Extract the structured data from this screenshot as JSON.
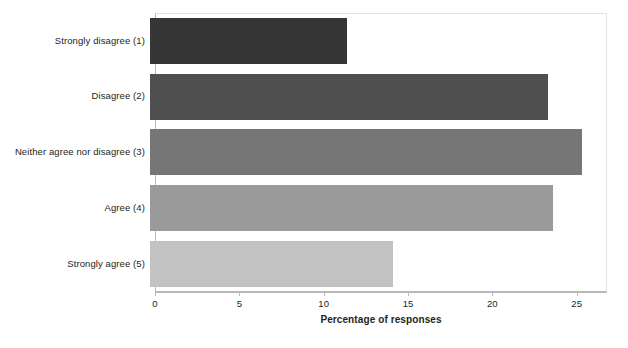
{
  "chart_data": {
    "type": "bar",
    "orientation": "horizontal",
    "title": "",
    "xlabel": "Percentage of responses",
    "ylabel": "",
    "xlim": [
      0,
      26.8
    ],
    "ylim": null,
    "grid": false,
    "legend": null,
    "xticks": [
      0,
      5,
      10,
      15,
      20,
      25
    ],
    "xtick_labels": [
      "0",
      "5",
      "10",
      "15",
      "20",
      "25"
    ],
    "categories": [
      "Strongly disagree (1)",
      "Disagree (2)",
      "Neither agree nor disagree (3)",
      "Agree (4)",
      "Strongly agree (5)"
    ],
    "values": [
      11.7,
      23.6,
      25.6,
      23.9,
      14.4
    ],
    "bar_colors": [
      "#363636",
      "#4f4f4f",
      "#767676",
      "#9a9a9a",
      "#c2c2c2"
    ]
  },
  "axis": {
    "x_title": "Percentage of responses"
  },
  "frame": {
    "border_color": "#e3e3e3",
    "axis_color": "#b9b9b9",
    "background": "#ffffff"
  }
}
